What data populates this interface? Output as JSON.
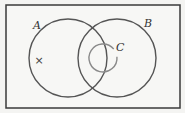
{
  "diagram": {
    "type": "venn",
    "universe": {
      "x": 6,
      "y": 5,
      "width": 174,
      "height": 103,
      "stroke": "#3a3a3a"
    },
    "sets": [
      {
        "name": "A",
        "label": "A",
        "cx": 68,
        "cy": 58,
        "r": 39,
        "stroke": "#555555",
        "label_x": 33,
        "label_y": 29
      },
      {
        "name": "B",
        "label": "B",
        "cx": 117,
        "cy": 58,
        "r": 39,
        "stroke": "#555555",
        "label_x": 144,
        "label_y": 27
      },
      {
        "name": "C",
        "label": "C",
        "cx": 103,
        "cy": 58,
        "r": 14,
        "stroke": "#8a8a8a",
        "label_x": 116,
        "label_y": 51
      }
    ],
    "marker": {
      "symbol": "×",
      "x": 39,
      "y": 64,
      "region": "A only"
    }
  }
}
